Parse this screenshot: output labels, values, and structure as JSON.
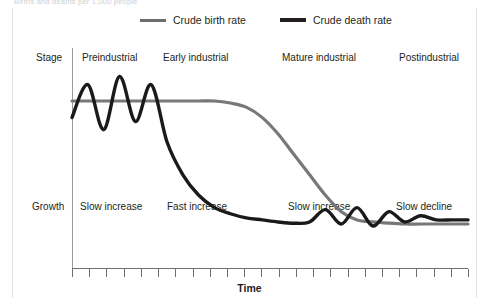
{
  "caption": {
    "text": "Births and deaths per 1,000 people"
  },
  "legend": {
    "position": "top-center",
    "items": [
      {
        "label": "Crude birth rate",
        "color": "#78787a",
        "icon": "line-swatch-icon"
      },
      {
        "label": "Crude death rate",
        "color": "#1a1a1a",
        "icon": "line-swatch-icon"
      }
    ]
  },
  "rows": {
    "stage_label": "Stage",
    "growth_label": "Growth",
    "stages": [
      {
        "stage": "Preindustrial",
        "growth": "Slow increase",
        "x": 82
      },
      {
        "stage": "Early industrial",
        "growth": "Fast increase",
        "x": 163
      },
      {
        "stage": "Mature industrial",
        "growth": "Slow increase",
        "x": 282
      },
      {
        "stage": "Postindustrial",
        "growth": "Slow decline",
        "x": 399
      }
    ],
    "stage_label_x": [
      82,
      163,
      282,
      399
    ],
    "growth_label_x": [
      80,
      167,
      288,
      396
    ]
  },
  "axes": {
    "x_title": "Time",
    "x_tick_count": 24,
    "y_title": ""
  },
  "chart_data": {
    "type": "line",
    "subtitle": "",
    "xlabel": "Time",
    "ylabel": "",
    "grid": false,
    "legend_position": "top",
    "x": [
      0,
      4,
      8,
      12,
      16,
      20,
      24,
      28,
      32,
      36,
      40,
      44,
      48,
      52,
      56,
      60,
      64,
      68,
      72,
      76,
      80,
      84,
      88,
      92,
      96,
      100
    ],
    "xlim": [
      0,
      100
    ],
    "ylim": [
      0,
      50
    ],
    "annotations": [
      "Stage: Preindustrial",
      "Stage: Early industrial",
      "Stage: Mature industrial",
      "Stage: Postindustrial",
      "Growth: Slow increase",
      "Growth: Fast increase",
      "Growth: Slow increase",
      "Growth: Slow decline"
    ],
    "series": [
      {
        "name": "Crude birth rate",
        "color": "#78787a",
        "values": [
          40,
          40,
          40,
          40,
          40,
          40,
          40,
          40,
          40,
          40,
          39.5,
          38.5,
          36,
          32,
          27,
          22,
          17,
          13,
          11,
          10.5,
          10.2,
          10,
          10,
          10,
          10,
          10
        ]
      },
      {
        "name": "Crude death rate",
        "color": "#1a1a1a",
        "values": [
          36,
          44,
          33,
          46,
          35,
          44,
          30,
          22,
          17,
          14,
          12.5,
          11.5,
          11,
          10.5,
          10.2,
          10.5,
          13.5,
          10,
          14,
          9.5,
          13,
          10.5,
          12,
          11,
          11,
          11
        ]
      }
    ]
  }
}
